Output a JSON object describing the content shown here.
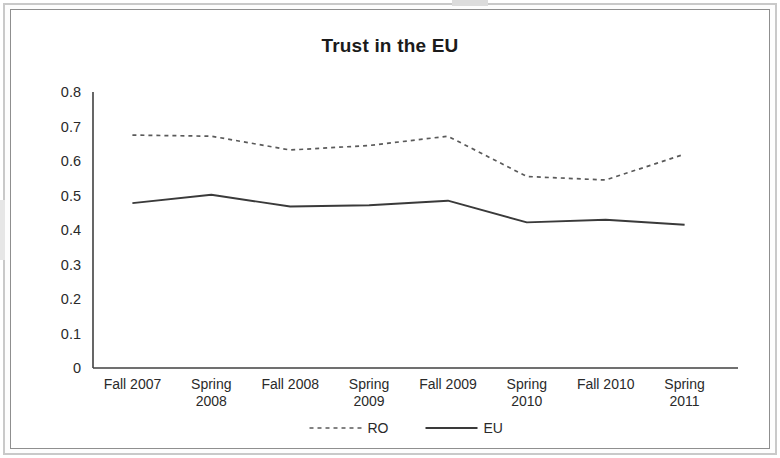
{
  "document": {
    "kind": "scanned-figure-page"
  },
  "chart_data": {
    "type": "line",
    "title": "Trust in the EU",
    "xlabel": "",
    "ylabel": "",
    "categories": [
      "Fall 2007",
      "Spring 2008",
      "Fall 2008",
      "Spring 2009",
      "Fall 2009",
      "Spring 2010",
      "Fall 2010",
      "Spring 2011"
    ],
    "category_lines": [
      [
        "Fall 2007"
      ],
      [
        "Spring",
        "2008"
      ],
      [
        "Fall 2008"
      ],
      [
        "Spring",
        "2009"
      ],
      [
        "Fall 2009"
      ],
      [
        "Spring",
        "2010"
      ],
      [
        "Fall 2010"
      ],
      [
        "Spring",
        "2011"
      ]
    ],
    "series": [
      {
        "name": "RO",
        "style": "dashed",
        "color": "#5a5a5a",
        "values": [
          0.675,
          0.672,
          0.632,
          0.645,
          0.672,
          0.555,
          0.545,
          0.62
        ]
      },
      {
        "name": "EU",
        "style": "solid",
        "color": "#3a3a3a",
        "values": [
          0.478,
          0.502,
          0.468,
          0.472,
          0.485,
          0.422,
          0.43,
          0.415
        ]
      }
    ],
    "ylim": [
      0,
      0.8
    ],
    "ytick_values": [
      0.8,
      0.7,
      0.6,
      0.5,
      0.4,
      0.3,
      0.2,
      0.1,
      0
    ],
    "ytick_labels": [
      "0.8",
      "0.7",
      "0.6",
      "0.5",
      "0.4",
      "0.3",
      "0.2",
      "0.1",
      "0"
    ],
    "grid": false,
    "legend_position": "bottom",
    "legend_entries": [
      "RO",
      "EU"
    ]
  }
}
